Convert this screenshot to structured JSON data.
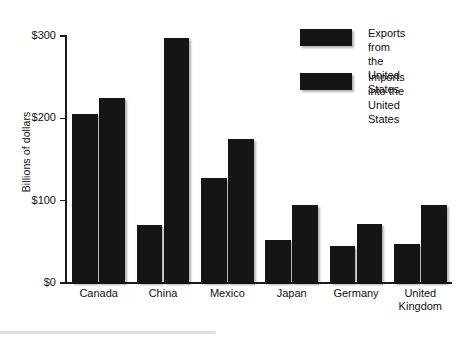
{
  "chart_data": {
    "type": "bar",
    "title": "",
    "subtitle": "",
    "xlabel": "",
    "ylabel": "Billions of dollars",
    "categories": [
      "Canada",
      "China",
      "Mexico",
      "Japan",
      "Germany",
      "United\nKingdom"
    ],
    "series": [
      {
        "name": "Exports from the\nUnited States",
        "color": "#151515",
        "values": [
          205,
          70,
          128,
          52,
          45,
          47
        ]
      },
      {
        "name": "Imports into the\nUnited States",
        "color": "#151515",
        "values": [
          225,
          297,
          175,
          95,
          72,
          95
        ]
      }
    ],
    "ylim": [
      0,
      300
    ],
    "yticks": [
      0,
      100,
      200,
      300
    ],
    "ytick_labels": [
      "$0",
      "$100",
      "$200",
      "$300"
    ],
    "grid": false,
    "legend_position": "top-right"
  },
  "legend": {
    "entries": [
      {
        "label": "Exports from the\nUnited States"
      },
      {
        "label": "Imports into the\nUnited States"
      }
    ]
  },
  "axes": {
    "y_title": "Billions of dollars"
  }
}
